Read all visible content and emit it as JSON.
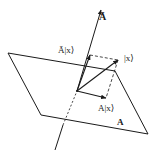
{
  "diagram": {
    "type": "projection-onto-subspace",
    "colors": {
      "stroke": "#1a1a1a",
      "background": "#ffffff"
    },
    "labels": {
      "complement_axis": "Ā",
      "projection_complement": "Ā|x⟩",
      "vector": "|x⟩",
      "projection": "A|x⟩",
      "plane": "A"
    },
    "nodes": [
      {
        "id": "origin",
        "x": 77,
        "y": 91
      },
      {
        "id": "x",
        "label": "|x⟩",
        "x": 118,
        "y": 60
      },
      {
        "id": "Ax",
        "label": "A|x⟩",
        "x": 106,
        "y": 98
      },
      {
        "id": "Abar_x",
        "label": "Ā|x⟩",
        "x": 90,
        "y": 55
      }
    ],
    "plane_A": {
      "label": "A",
      "corners": [
        [
          8,
          53
        ],
        [
          41,
          115
        ],
        [
          148,
          134
        ],
        [
          115,
          71
        ]
      ]
    },
    "axis_Abar": {
      "label": "Ā",
      "from": [
        55,
        150
      ],
      "to": [
        102,
        6
      ]
    },
    "edges": [
      {
        "from": "origin",
        "to": "x",
        "style": "solid-arrow"
      },
      {
        "from": "origin",
        "to": "Ax",
        "style": "solid-arrow"
      },
      {
        "from": "origin",
        "to": "Abar_x",
        "style": "solid-arrow"
      },
      {
        "from": "Abar_x",
        "to": "x",
        "style": "dashed"
      },
      {
        "from": "x",
        "to": "Ax",
        "style": "dashed"
      }
    ]
  }
}
